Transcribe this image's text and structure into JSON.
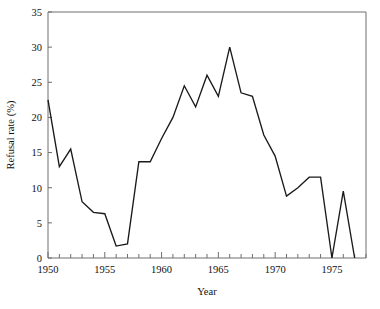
{
  "chart_data": {
    "type": "line",
    "title": "",
    "xlabel": "Year",
    "ylabel": "Refusal rate (%)",
    "xlim": [
      1950,
      1978
    ],
    "ylim": [
      0,
      35
    ],
    "grid": false,
    "legend": "none",
    "y_ticks": [
      0,
      5,
      10,
      15,
      20,
      25,
      30,
      35
    ],
    "y_tick_labels": [
      "0",
      "5",
      "10",
      "15",
      "20",
      "25",
      "30",
      "35"
    ],
    "x_ticks": [
      1950,
      1951,
      1952,
      1953,
      1954,
      1955,
      1956,
      1957,
      1958,
      1959,
      1960,
      1961,
      1962,
      1963,
      1964,
      1965,
      1966,
      1967,
      1968,
      1969,
      1970,
      1971,
      1972,
      1973,
      1974,
      1975,
      1976,
      1977,
      1978
    ],
    "x_tick_labels_shown": [
      "1950",
      "1955",
      "1960",
      "1965",
      "1970",
      "1975"
    ],
    "x_labelled_ticks": [
      1950,
      1955,
      1960,
      1965,
      1970,
      1975
    ],
    "series": [
      {
        "name": "Refusal rate",
        "color": "#1a1a1a",
        "x": [
          1950,
          1951,
          1952,
          1953,
          1954,
          1955,
          1956,
          1957,
          1958,
          1959,
          1960,
          1961,
          1962,
          1963,
          1964,
          1965,
          1966,
          1967,
          1968,
          1969,
          1970,
          1971,
          1972,
          1973,
          1974,
          1975,
          1976,
          1977
        ],
        "values": [
          22.5,
          13.0,
          15.5,
          8.0,
          6.5,
          6.3,
          1.7,
          2.0,
          13.7,
          13.7,
          17.0,
          20.0,
          24.5,
          21.5,
          26.0,
          23.0,
          30.0,
          23.5,
          23.0,
          17.5,
          14.5,
          8.8,
          10.0,
          11.5,
          11.5,
          0.0,
          9.5,
          0.0
        ]
      }
    ]
  },
  "axes": {
    "ylabel": "Refusal rate (%)",
    "xlabel": "Year"
  }
}
